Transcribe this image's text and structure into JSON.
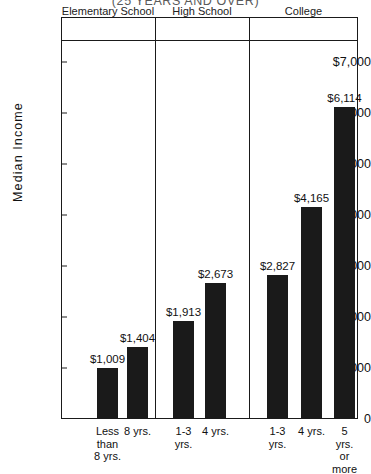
{
  "chart_data": {
    "type": "bar",
    "title": "(25 YEARS AND OVER)",
    "xlabel": "",
    "ylabel": "Median Income",
    "ylim": [
      0,
      7000
    ],
    "grid": false,
    "legend": "none",
    "y_ticks": [
      "$7,000",
      "6,000",
      "5,000",
      "4,000",
      "3,000",
      "2,000",
      "1,000",
      "0"
    ],
    "y_tick_values": [
      7000,
      6000,
      5000,
      4000,
      3000,
      2000,
      1000,
      0
    ],
    "groups": [
      {
        "name": "Elementary School",
        "categories": [
          "Less\nthan\n8 yrs.",
          "8 yrs."
        ],
        "values": [
          1009,
          1404
        ],
        "data_labels": [
          "$1,009",
          "$1,404"
        ]
      },
      {
        "name": "High School",
        "categories": [
          "1-3\nyrs.",
          "4 yrs."
        ],
        "values": [
          1913,
          2673
        ],
        "data_labels": [
          "$1,913",
          "$2,673"
        ]
      },
      {
        "name": "College",
        "categories": [
          "1-3\nyrs.",
          "4 yrs.",
          "5 yrs.\nor more"
        ],
        "values": [
          2827,
          4165,
          6114
        ],
        "data_labels": [
          "$2,827",
          "$4,165",
          "$6,114"
        ]
      }
    ],
    "categories": [
      "Less than 8 yrs.",
      "8 yrs.",
      "1-3 yrs.",
      "4 yrs.",
      "1-3 yrs.",
      "4 yrs.",
      "5 yrs. or more"
    ],
    "values": [
      1009,
      1404,
      1913,
      2673,
      2827,
      4165,
      6114
    ],
    "bar_color": "#1a1a1a"
  }
}
